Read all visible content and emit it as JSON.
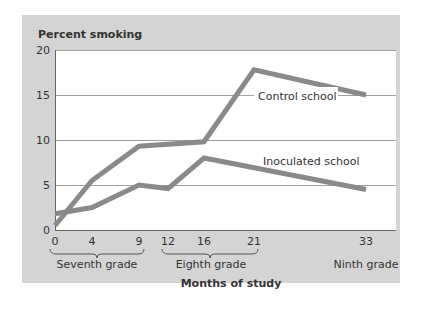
{
  "chart_data": {
    "type": "line",
    "title": "",
    "ylabel": "Percent smoking",
    "xlabel": "Months of study",
    "ylim": [
      0,
      20
    ],
    "yticks": [
      0,
      5,
      10,
      15,
      20
    ],
    "xticks": [
      0,
      4,
      9,
      12,
      16,
      21,
      33
    ],
    "grid": true,
    "groups": [
      {
        "label": "Seventh grade",
        "range": [
          0,
          9
        ]
      },
      {
        "label": "Eighth grade",
        "range": [
          12,
          21
        ]
      },
      {
        "label": "Ninth grade",
        "range": [
          33,
          33
        ]
      }
    ],
    "series": [
      {
        "name": "Control school",
        "x": [
          0,
          4,
          9,
          16,
          21,
          33
        ],
        "values": [
          0.5,
          5.5,
          9.3,
          9.8,
          17.8,
          15.0
        ]
      },
      {
        "name": "Inoculated school",
        "x": [
          0,
          4,
          9,
          12,
          16,
          33
        ],
        "values": [
          1.8,
          2.5,
          5.0,
          4.6,
          8.0,
          4.5
        ]
      }
    ],
    "colors": {
      "background": "#d4d4d4",
      "plot": "#ffffff",
      "line": "#8a8a8a",
      "grid": "#999999"
    }
  },
  "labels": {
    "ylabel": "Percent smoking",
    "xlabel": "Months of study",
    "control": "Control school",
    "inoculated": "Inoculated school",
    "grade7": "Seventh grade",
    "grade8": "Eighth grade",
    "grade9": "Ninth grade",
    "y": [
      "0",
      "5",
      "10",
      "15",
      "20"
    ],
    "x": [
      "0",
      "4",
      "9",
      "12",
      "16",
      "21",
      "33"
    ]
  }
}
